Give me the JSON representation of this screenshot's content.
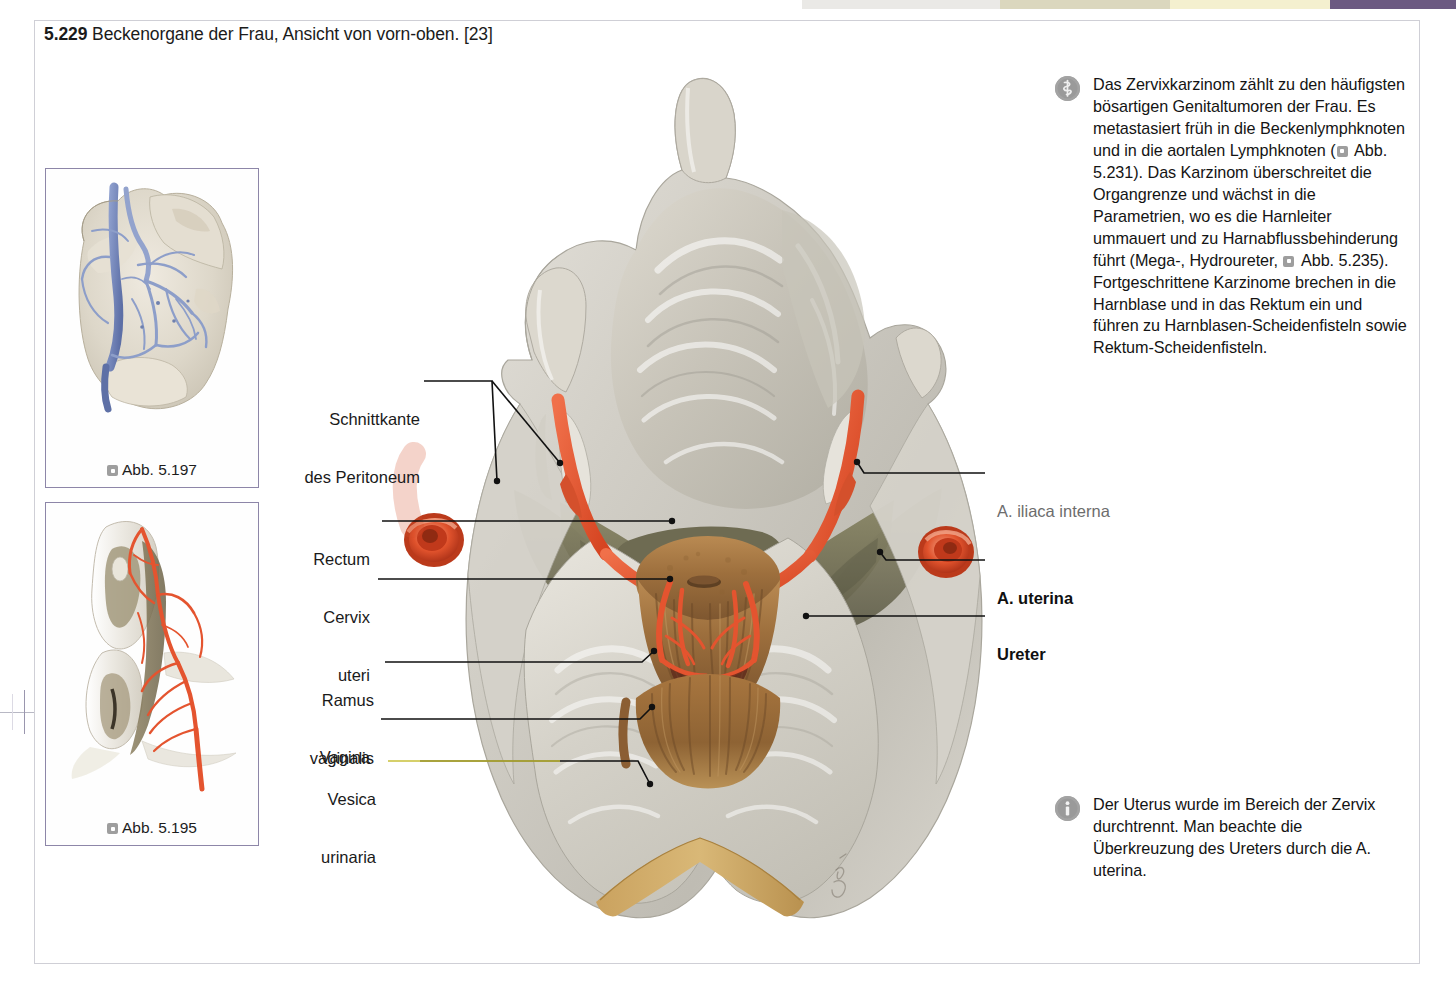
{
  "figure": {
    "number": "5.229",
    "title": "Beckenorgane der Frau, Ansicht von vorn-oben.",
    "source": "[23]"
  },
  "thumbnails": [
    {
      "caption": "Abb. 5.197",
      "icon": "reference-square-icon",
      "subject": "Becken mit Venenplexus, Ansicht von vorn",
      "palette": {
        "vessel": "#7d8fc0",
        "tissue": "#ded8cc"
      }
    },
    {
      "caption": "Abb. 5.195",
      "icon": "reference-square-icon",
      "subject": "Aeussere weibliche Genitalien mit Arterien",
      "palette": {
        "vessel": "#e8573a",
        "tissue": "#e9e5de"
      }
    }
  ],
  "notes": {
    "clinical": {
      "icon": "asclepius-rod-icon",
      "paragraphs": [
        "Das Zervixkarzinom zählt zu den häufigsten bösartigen Genitaltumoren der Frau. Es metastasiert früh in die Beckenlymphknoten und in die aortalen Lymphknoten (",
        " Abb. 5.231). Das Karzinom überschreitet die Organgrenze und wächst in die Parametrien, wo es die Harnleiter ummauert und zu Harnabflussbehinderung führt (Mega-, Hydroureter, ",
        " Abb. 5.235). Fortgeschrittene Karzinome brechen in die Harnblase und in das Rektum ein und führen zu Harnblasen-Scheidenfisteln sowie Rektum-Scheidenfisteln."
      ]
    },
    "info": {
      "icon": "info-circle-icon",
      "text": "Der Uterus wurde im Bereich der Zervix durchtrennt. Man beachte die Überkreuzung des Ureters durch die A. uterina."
    }
  },
  "labels": {
    "left": [
      {
        "id": "schnittkante-des-peritoneum",
        "line1": "Schnittkante",
        "line2": "des Peritoneum",
        "style": "normal"
      },
      {
        "id": "rectum",
        "line1": "Rectum",
        "line2": "",
        "style": "normal"
      },
      {
        "id": "cervix-uteri",
        "line1": "Cervix",
        "line2": "uteri",
        "style": "normal"
      },
      {
        "id": "ramus-vaginalis",
        "line1": "Ramus",
        "line2": "vaginalis",
        "style": "normal"
      },
      {
        "id": "vagina",
        "line1": "Vagina",
        "line2": "",
        "style": "normal"
      },
      {
        "id": "vesica-urinaria",
        "line1": "Vesica",
        "line2": "urinaria",
        "style": "normal"
      }
    ],
    "right": [
      {
        "id": "a-iliaca-interna",
        "text": "A. iliaca interna",
        "style": "gray"
      },
      {
        "id": "a-uterina",
        "text": "A. uterina",
        "style": "bold"
      },
      {
        "id": "ureter",
        "text": "Ureter",
        "style": "bold"
      }
    ]
  },
  "colors": {
    "accent_purple": "#6c5a82",
    "leader_line": "#111111",
    "leader_line_bladder": "#c9c13a",
    "artery_red": "#e4542f",
    "peritoneum_gray": "#d6d3cc",
    "parametrium_olive": "#7d7a5c",
    "cervix_brown": "#9d6f3d",
    "frame_border": "#cfcfd6"
  }
}
